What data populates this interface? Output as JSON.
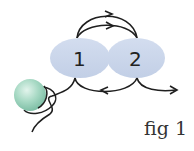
{
  "diagram": {
    "nodes": [
      {
        "id": "1",
        "label": "1",
        "shape": "ellipse",
        "color": "#c9d5ea"
      },
      {
        "id": "2",
        "label": "2",
        "shape": "ellipse",
        "color": "#c9d5ea"
      }
    ],
    "bead": {
      "shape": "sphere",
      "color": "#8fcdb4"
    },
    "edges": [
      {
        "from": "1",
        "to": "2",
        "type": "upper-arc-arrow"
      },
      {
        "from": "1",
        "to": "2",
        "type": "upper-arc-arrow"
      },
      {
        "from": "2",
        "to": "1",
        "type": "lower-arc-arrow"
      },
      {
        "from": "2",
        "to": "right",
        "type": "lower-exit-arrow"
      },
      {
        "from": "1",
        "to": "bead",
        "type": "tether-line"
      }
    ],
    "caption": "fig 1"
  }
}
